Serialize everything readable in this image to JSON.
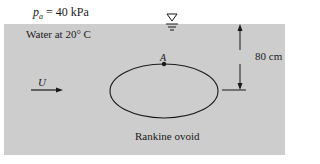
{
  "figure": {
    "atmospheric_pressure": {
      "symbol": "p",
      "subscript": "a",
      "value_text": " = 40 kPa"
    },
    "fluid_label": "Water at 20° C",
    "free_stream_velocity_label": "U",
    "point_label": "A",
    "depth_dimension_label": "80 cm",
    "body_label": "Rankine ovoid",
    "colors": {
      "water": "#cdcdcd",
      "lines": "#1a1a1a",
      "background": "#ffffff"
    }
  }
}
